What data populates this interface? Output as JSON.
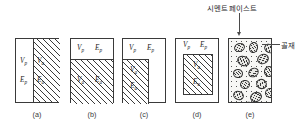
{
  "figure": {
    "type": "technical-diagram",
    "symbols": {
      "paste_volume": "V",
      "paste_volume_sub": "p",
      "paste_modulus": "E",
      "paste_modulus_sub": "p",
      "aggregate_volume": "V",
      "aggregate_volume_sub": "a",
      "aggregate_modulus": "E",
      "aggregate_modulus_sub": "a"
    },
    "callouts": {
      "cement_paste": "시멘트 페이스트",
      "aggregate": "골재"
    },
    "panels": [
      {
        "id": "a",
        "caption": "(a)",
        "description": "parallel model: vertical split, left paste, right aggregate",
        "labels": {
          "left_volume": "V",
          "left_volume_sub": "p",
          "left_modulus": "E",
          "left_modulus_sub": "p",
          "right_volume": "V",
          "right_volume_sub": "a",
          "right_modulus": "E",
          "right_modulus_sub": "a"
        }
      },
      {
        "id": "b",
        "caption": "(b)",
        "description": "series model: horizontal split, top paste, bottom aggregate",
        "labels": {
          "top_volume": "V",
          "top_volume_sub": "p",
          "top_modulus": "E",
          "top_modulus_sub": "p",
          "bottom_volume": "V",
          "bottom_volume_sub": "a",
          "bottom_modulus": "E",
          "bottom_modulus_sub": "a"
        }
      },
      {
        "id": "c",
        "caption": "(c)",
        "description": "combined model: paste band on top, aggregate column on lower left",
        "labels": {
          "top_volume": "V",
          "top_volume_sub": "p",
          "top_modulus": "E",
          "top_modulus_sub": "p",
          "inner_volume": "V",
          "inner_volume_sub": "a",
          "inner_modulus": "E",
          "inner_modulus_sub": "a"
        }
      },
      {
        "id": "d",
        "caption": "(d)",
        "description": "enclosed model: aggregate core surrounded by paste",
        "labels": {
          "outer_volume": "V",
          "outer_volume_sub": "p",
          "outer_modulus": "E",
          "outer_modulus_sub": "p",
          "inner_volume": "V",
          "inner_volume_sub": "a",
          "inner_modulus": "E",
          "inner_modulus_sub": "a"
        }
      },
      {
        "id": "e",
        "caption": "(e)",
        "description": "real concrete: aggregate particles dispersed in cement paste matrix",
        "aggregate_count": 14
      }
    ],
    "aggregate_particles": [
      {
        "x": 5,
        "y": 4,
        "w": 9,
        "h": 7,
        "rot": -18
      },
      {
        "x": 20,
        "y": 3,
        "w": 7,
        "h": 9,
        "rot": 12
      },
      {
        "x": 35,
        "y": 5,
        "w": 9,
        "h": 7,
        "rot": 28
      },
      {
        "x": 8,
        "y": 17,
        "w": 11,
        "h": 8,
        "rot": 20
      },
      {
        "x": 28,
        "y": 15,
        "w": 10,
        "h": 8,
        "rot": -25
      },
      {
        "x": 4,
        "y": 30,
        "w": 8,
        "h": 7,
        "rot": 8
      },
      {
        "x": 19,
        "y": 29,
        "w": 9,
        "h": 7,
        "rot": -35
      },
      {
        "x": 35,
        "y": 27,
        "w": 8,
        "h": 9,
        "rot": 15
      },
      {
        "x": 11,
        "y": 41,
        "w": 8,
        "h": 7,
        "rot": -12
      },
      {
        "x": 27,
        "y": 40,
        "w": 9,
        "h": 8,
        "rot": 33
      },
      {
        "x": 4,
        "y": 52,
        "w": 9,
        "h": 7,
        "rot": 22
      },
      {
        "x": 21,
        "y": 53,
        "w": 10,
        "h": 8,
        "rot": -20
      },
      {
        "x": 36,
        "y": 49,
        "w": 8,
        "h": 8,
        "rot": 10
      },
      {
        "x": 13,
        "y": 63,
        "w": 9,
        "h": 7,
        "rot": -28
      }
    ],
    "colors": {
      "stroke": "#3a3a3a",
      "hatch": "#3a3a3a",
      "matrix": "#f7f7f5",
      "background": "#ffffff",
      "text": "#2b2b2b"
    }
  }
}
